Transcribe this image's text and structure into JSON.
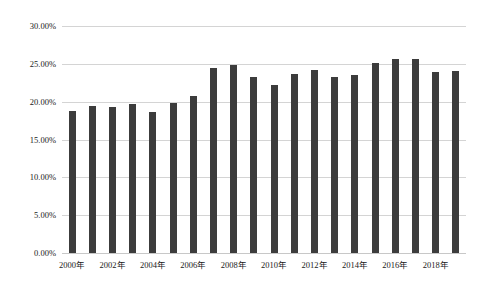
{
  "chart_data": {
    "type": "bar",
    "title": "",
    "subtitle": "",
    "xlabel": "",
    "ylabel": "",
    "ylim": [
      0,
      30
    ],
    "ytick_format": "percent",
    "grid": true,
    "legend": "none",
    "bar_color": "#3c3c3c",
    "gridline_color": "#d4d4d4",
    "ytick_labels": [
      "30.00%",
      "25.00%",
      "20.00%",
      "15.00%",
      "10.00%",
      "5.00%",
      "0.00%"
    ],
    "ytick_values": [
      30,
      25,
      20,
      15,
      10,
      5,
      0
    ],
    "xtick_labels": [
      "2000年",
      "2002年",
      "2004年",
      "2006年",
      "2008年",
      "2010年",
      "2012年",
      "2014年",
      "2016年",
      "2018年"
    ],
    "categories": [
      "2000年",
      "2001年",
      "2002年",
      "2003年",
      "2004年",
      "2005年",
      "2006年",
      "2007年",
      "2008年",
      "2009年",
      "2010年",
      "2011年",
      "2012年",
      "2013年",
      "2014年",
      "2015年",
      "2016年",
      "2017年",
      "2018年",
      "2019年"
    ],
    "values": [
      18.8,
      19.4,
      19.3,
      19.7,
      18.6,
      19.8,
      20.8,
      24.5,
      24.9,
      23.3,
      22.2,
      23.6,
      24.2,
      23.2,
      23.5,
      25.1,
      25.7,
      25.6,
      23.9,
      24.1
    ]
  }
}
